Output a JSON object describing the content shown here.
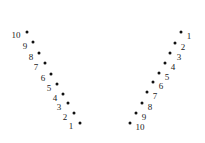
{
  "canvas": {
    "width": 205,
    "height": 143,
    "background": "#ffffff",
    "dot_color": "#111111",
    "label_color": "#222222"
  },
  "chart_data": {
    "type": "scatter",
    "title": "",
    "subtitle": "",
    "xlabel": "",
    "ylabel": "",
    "xlim": [
      0,
      205
    ],
    "ylim": [
      0,
      143
    ],
    "grid": false,
    "legend": "none",
    "annotations": "Each point is annotated with its sequence number 1-10; two mirrored diagonal point sequences form a V shape.",
    "series": [
      {
        "name": "left-branch",
        "label_side": "left",
        "points": [
          {
            "label": "1",
            "x": 80,
            "y": 123,
            "label_x": 71,
            "label_y": 126
          },
          {
            "label": "2",
            "x": 74,
            "y": 113,
            "label_x": 65,
            "label_y": 117
          },
          {
            "label": "3",
            "x": 68,
            "y": 103,
            "label_x": 59,
            "label_y": 107
          },
          {
            "label": "4",
            "x": 63,
            "y": 94,
            "label_x": 55,
            "label_y": 98
          },
          {
            "label": "5",
            "x": 57,
            "y": 84,
            "label_x": 49,
            "label_y": 88
          },
          {
            "label": "6",
            "x": 51,
            "y": 74,
            "label_x": 43,
            "label_y": 78
          },
          {
            "label": "7",
            "x": 45,
            "y": 63,
            "label_x": 36,
            "label_y": 67
          },
          {
            "label": "8",
            "x": 39,
            "y": 53,
            "label_x": 31,
            "label_y": 57
          },
          {
            "label": "9",
            "x": 33,
            "y": 42,
            "label_x": 25,
            "label_y": 46
          },
          {
            "label": "10",
            "x": 27,
            "y": 32,
            "label_x": 16,
            "label_y": 35
          }
        ]
      },
      {
        "name": "right-branch",
        "label_side": "right",
        "points": [
          {
            "label": "1",
            "x": 181,
            "y": 32,
            "label_x": 189,
            "label_y": 36
          },
          {
            "label": "2",
            "x": 175,
            "y": 43,
            "label_x": 183,
            "label_y": 47
          },
          {
            "label": "3",
            "x": 170,
            "y": 53,
            "label_x": 179,
            "label_y": 57
          },
          {
            "label": "4",
            "x": 165,
            "y": 63,
            "label_x": 173,
            "label_y": 67
          },
          {
            "label": "5",
            "x": 159,
            "y": 73,
            "label_x": 167,
            "label_y": 77
          },
          {
            "label": "6",
            "x": 153,
            "y": 82,
            "label_x": 161,
            "label_y": 86
          },
          {
            "label": "7",
            "x": 147,
            "y": 92,
            "label_x": 155,
            "label_y": 96
          },
          {
            "label": "8",
            "x": 142,
            "y": 103,
            "label_x": 150,
            "label_y": 107
          },
          {
            "label": "9",
            "x": 136,
            "y": 113,
            "label_x": 144,
            "label_y": 117
          },
          {
            "label": "10",
            "x": 130,
            "y": 123,
            "label_x": 140,
            "label_y": 127
          }
        ]
      }
    ]
  }
}
